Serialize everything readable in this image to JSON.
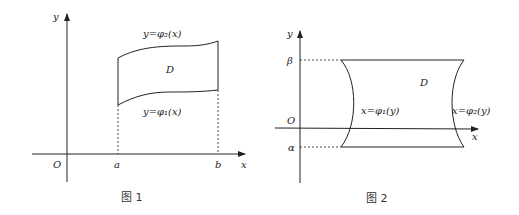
{
  "figure1": {
    "axis_y_label": "y",
    "axis_x_label": "x",
    "origin_label": "O",
    "left_bound_label": "a",
    "right_bound_label": "b",
    "region_label": "D",
    "upper_curve_label": "y=φ₂(x)",
    "lower_curve_label": "y=φ₁(x)",
    "caption": "图 1"
  },
  "figure2": {
    "axis_y_label": "y",
    "axis_x_label": "x",
    "origin_label": "O",
    "upper_bound_label": "β",
    "lower_bound_label": "α",
    "region_label": "D",
    "left_curve_label": "x=φ₁(y)",
    "right_curve_label": "x=φ₂(y)",
    "caption": "图 2"
  },
  "colors": {
    "stroke": "#222222",
    "background": "#ffffff"
  }
}
